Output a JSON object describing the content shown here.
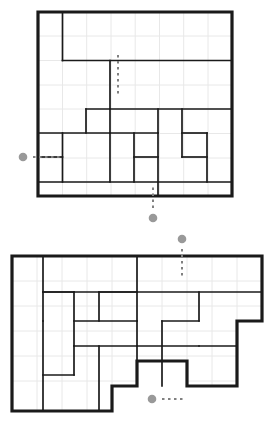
{
  "page": {
    "background_color": "#ffffff",
    "wall_color": "#1a1a1a",
    "grid_line_color": "#e8e8e8",
    "marker_color": "#999999",
    "dash_color": "#808080"
  },
  "puzzles": [
    {
      "id": "top-puzzle",
      "label": "Top grid puzzle",
      "origin": {
        "x": 38,
        "y": 12
      },
      "cell": 24.25,
      "cols": 8,
      "rows": 7.6,
      "outline": "M38,12 L232,12 L232,196 L38,196 Z",
      "interior_walls": [
        "M62.5,12 L62.5,60.5",
        "M62.5,60.5 L232,60.5",
        "M110,60.5 L110,109",
        "M86,109 L232,109",
        "M38,133 L110,133",
        "M110,109 L110,182",
        "M86,109 L86,133",
        "M38,157 L62.5,157",
        "M62.5,133 L62.5,182",
        "M38,182 L232,182",
        "M110,133 L158,133",
        "M158,109 L158,133",
        "M158,133 L158,196",
        "M134,133 L134,182",
        "M134,157 L158,157",
        "M182,109 L182,157",
        "M182,157 L207,157",
        "M207,133 L207,182",
        "M182,133 L207,133"
      ],
      "grid_lines": {
        "vertical_x": [
          62.5,
          86.7,
          111,
          135.2,
          159.5,
          183.7,
          208
        ],
        "horizontal_y": [
          36,
          60.5,
          85,
          109,
          133.5,
          158,
          182
        ]
      },
      "markers": [
        {
          "name": "entry-marker-left",
          "dot": {
            "cx": 23,
            "cy": 157
          },
          "dash": {
            "x1": 33,
            "y1": 157,
            "x2": 62,
            "y2": 157
          },
          "orientation": "horizontal"
        },
        {
          "name": "entry-marker-bottom",
          "dot": {
            "cx": 153,
            "cy": 218
          },
          "dash": {
            "x1": 153,
            "y1": 208,
            "x2": 153,
            "y2": 184
          },
          "orientation": "vertical"
        },
        {
          "name": "interior-dash-marker",
          "dot": null,
          "dash": {
            "x1": 118,
            "y1": 55,
            "x2": 118,
            "y2": 97
          },
          "orientation": "vertical"
        }
      ]
    },
    {
      "id": "bottom-puzzle",
      "label": "Bottom grid puzzle",
      "origin": {
        "x": 12,
        "y": 256
      },
      "cell": 25,
      "cols": 10,
      "rows": 6.2,
      "outline": "M12,256 L262,256 L262,321 L237,321 L237,386 L187,386 L187,361 L137,361 L137,386 L112,386 L112,411 L12,411 Z",
      "interior_walls": [
        "M43,256 L43,411",
        "M43,292 L74,292",
        "M74,292 L74,346",
        "M137,256 L137,321",
        "M99,292 L137,292",
        "M99,292 L99,321",
        "M74,321 L137,321",
        "M74,346 L137,346",
        "M99,346 L99,411",
        "M137,321 L137,361",
        "M162,321 L162,386",
        "M162,321 L199,321",
        "M199,292 L199,321",
        "M137,346 L199,346",
        "M199,346 L237,346",
        "M43,375 L74,375",
        "M74,346 L74,375",
        "M43,321 L43,321",
        "M237,321 L262,321",
        "M43,292 L262,292"
      ],
      "grid_lines": {
        "vertical_x": [
          37,
          62,
          87,
          112,
          137,
          162,
          187,
          212,
          237
        ],
        "horizontal_y": [
          281,
          306,
          331,
          356,
          381
        ]
      },
      "markers": [
        {
          "name": "entry-marker-top",
          "dot": {
            "cx": 182,
            "cy": 239
          },
          "dash": {
            "x1": 182,
            "y1": 249,
            "x2": 182,
            "y2": 278
          },
          "orientation": "vertical"
        },
        {
          "name": "entry-marker-notch",
          "dot": {
            "cx": 152,
            "cy": 399
          },
          "dash": {
            "x1": 162,
            "y1": 399,
            "x2": 186,
            "y2": 399
          },
          "orientation": "horizontal"
        }
      ]
    }
  ]
}
